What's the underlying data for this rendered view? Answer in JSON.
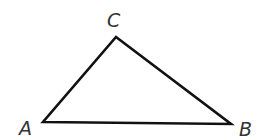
{
  "diagram": {
    "type": "triangle",
    "stroke_color": "#111111",
    "label_color": "#333333",
    "vertices": [
      {
        "name": "A",
        "x": 43,
        "y": 122,
        "label": "A",
        "label_x": 19,
        "label_y": 135
      },
      {
        "name": "B",
        "x": 231,
        "y": 124,
        "label": "B",
        "label_x": 239,
        "label_y": 136
      },
      {
        "name": "C",
        "x": 116,
        "y": 37,
        "label": "C",
        "label_x": 107,
        "label_y": 27
      }
    ]
  }
}
